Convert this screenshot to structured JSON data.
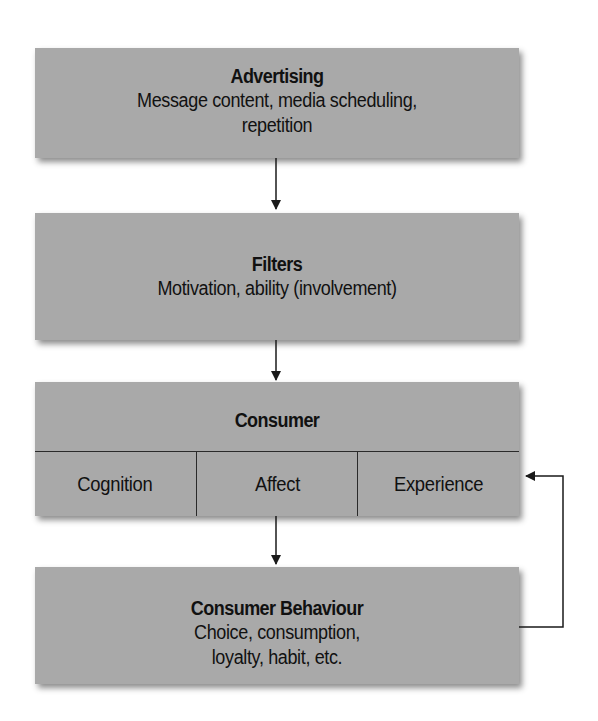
{
  "diagram": {
    "boxes": {
      "advertising": {
        "title": "Advertising",
        "line1": "Message content, media scheduling,",
        "line2": "repetition"
      },
      "filters": {
        "title": "Filters",
        "line1": "Motivation, ability (involvement)"
      },
      "consumer": {
        "title": "Consumer",
        "cells": [
          "Cognition",
          "Affect",
          "Experience"
        ]
      },
      "behaviour": {
        "title": "Consumer Behaviour",
        "line1": "Choice, consumption,",
        "line2": "loyalty, habit, etc."
      }
    },
    "colors": {
      "box_fill": "#a9a9a9",
      "line": "#1a1a1a",
      "background": "#ffffff"
    },
    "edges": [
      {
        "from": "Advertising",
        "to": "Filters"
      },
      {
        "from": "Filters",
        "to": "Consumer"
      },
      {
        "from": "Consumer",
        "to": "Consumer Behaviour"
      },
      {
        "from": "Consumer Behaviour",
        "to": "Experience",
        "type": "feedback"
      }
    ]
  }
}
